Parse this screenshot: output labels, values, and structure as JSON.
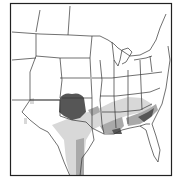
{
  "map": {
    "type": "shaded-region map",
    "region": "Contiguous United States (central and eastern)",
    "colors": {
      "background": "#ffffff",
      "border": "#222222",
      "state_lines": "#333333",
      "shade_dark": "#555555",
      "shade_medium": "#a8a8a8",
      "shade_light": "#d6d6d6"
    },
    "shaded_areas": [
      {
        "level": "dark",
        "location": "Oklahoma / southern Kansas"
      },
      {
        "level": "medium",
        "location": "Louisiana and Gulf Coast"
      },
      {
        "level": "medium",
        "location": "Georgia / South Carolina coast"
      },
      {
        "level": "light",
        "location": "Central Texas corridor"
      },
      {
        "level": "light",
        "location": "Lower Mississippi valley and Southeast"
      }
    ]
  }
}
